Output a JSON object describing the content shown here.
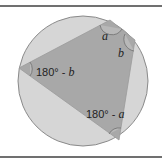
{
  "diagram": {
    "colors": {
      "circle_fill": "#d6d6d6",
      "circle_stroke": "#8a8a8a",
      "quad_fill": "#a8a8a8",
      "arc_stroke": "#6f6f6f",
      "rule": "#707070"
    },
    "labels": {
      "angle_top": "a",
      "angle_right": "b",
      "angle_left_num": "180° - ",
      "angle_left_var": "b",
      "angle_bottom_num": "180° - ",
      "angle_bottom_var": "a"
    }
  }
}
